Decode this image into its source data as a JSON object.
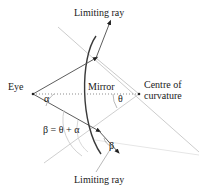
{
  "figure": {
    "kind": "optics-ray-diagram",
    "background": "#ffffff",
    "stroke_dark": "#2b2b2b",
    "stroke_light": "#c9c9c9",
    "stroke_faint": "#e0e0e0",
    "text_color": "#1a1a1a"
  },
  "labels": {
    "limiting_ray_top": "Limiting ray",
    "limiting_ray_bottom": "Limiting ray",
    "eye": "Eye",
    "mirror": "Mirror",
    "centre_line1": "Centre of",
    "centre_line2": "curvature",
    "alpha": "α",
    "theta": "θ",
    "beta": "β",
    "beta_equation": "β = θ + α"
  },
  "geometry": {
    "eye_point": [
      33,
      94
    ],
    "centre_point": [
      139,
      94
    ],
    "mirror_top_contact": [
      96,
      58
    ],
    "mirror_bottom_contact": [
      99,
      130
    ],
    "mirror_vertex": [
      86,
      94
    ],
    "axis": "dotted horizontal from eye to centre of curvature",
    "angles": {
      "alpha_at": "eye",
      "theta_at": "centre of curvature",
      "beta_at": "lower ray intersection"
    }
  }
}
